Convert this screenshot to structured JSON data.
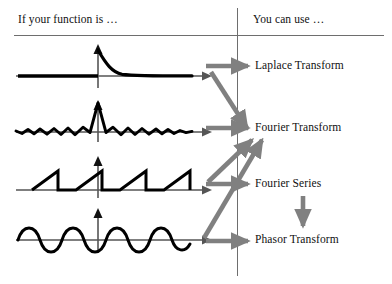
{
  "header": {
    "left": "If your function is …",
    "right": "You can use …"
  },
  "colors": {
    "ink": "#101010",
    "rule": "#6e6e6e",
    "curve": "#000000",
    "arrow": "#808080"
  },
  "left_column": {
    "rows": [
      {
        "id": "row-exponential",
        "waveform": "decaying-exponential",
        "description": "Decaying exponential, zero for t<0"
      },
      {
        "id": "row-sinc",
        "waveform": "sinc",
        "description": "Sinc function with central peak and decaying ripples"
      },
      {
        "id": "row-sawtooth",
        "waveform": "sawtooth",
        "description": "Periodic sawtooth wave"
      },
      {
        "id": "row-sinusoid",
        "waveform": "sinusoid",
        "description": "Continuous sinusoid"
      }
    ]
  },
  "right_column": {
    "items": [
      {
        "id": "laplace-transform",
        "label": "Laplace Transform"
      },
      {
        "id": "fourier-transform",
        "label": "Fourier Transform"
      },
      {
        "id": "fourier-series",
        "label": "Fourier Series"
      },
      {
        "id": "phasor-transform",
        "label": "Phasor Transform"
      }
    ]
  },
  "connections": [
    {
      "id": "exponential-to-laplace",
      "from": "row-exponential",
      "to": "laplace-transform",
      "kind": "horizontal"
    },
    {
      "id": "exponential-to-fourier",
      "from": "row-exponential",
      "to": "fourier-transform",
      "kind": "diagonal-down"
    },
    {
      "id": "sinc-to-fourier",
      "from": "row-sinc",
      "to": "fourier-transform",
      "kind": "horizontal"
    },
    {
      "id": "sawtooth-to-fourier-series",
      "from": "row-sawtooth",
      "to": "fourier-series",
      "kind": "horizontal"
    },
    {
      "id": "sawtooth-to-fourier",
      "from": "row-sawtooth",
      "to": "fourier-transform",
      "kind": "diagonal-up"
    },
    {
      "id": "sinusoid-to-phasor",
      "from": "row-sinusoid",
      "to": "phasor-transform",
      "kind": "horizontal"
    },
    {
      "id": "sinusoid-to-fourier",
      "from": "row-sinusoid",
      "to": "fourier-transform",
      "kind": "diagonal-up"
    },
    {
      "id": "series-to-phasor",
      "from": "fourier-series",
      "to": "phasor-transform",
      "kind": "vertical-down"
    }
  ]
}
